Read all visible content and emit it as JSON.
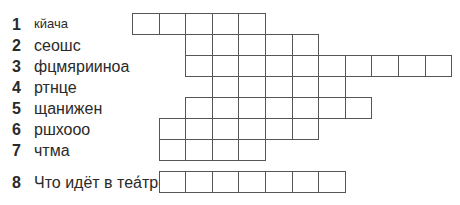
{
  "crossword": {
    "rows": [
      {
        "number": "1",
        "clue": "кйача",
        "start_col": 0,
        "cells": 5
      },
      {
        "number": "2",
        "clue": "сеошс",
        "start_col": 2,
        "cells": 5
      },
      {
        "number": "3",
        "clue": "фцмяриинoа",
        "start_col": 2,
        "cells": 10
      },
      {
        "number": "4",
        "clue": "ртнце",
        "start_col": 3,
        "cells": 5
      },
      {
        "number": "5",
        "clue": "щанижен",
        "start_col": 2,
        "cells": 7
      },
      {
        "number": "6",
        "clue": "ршхооо",
        "start_col": 1,
        "cells": 6
      },
      {
        "number": "7",
        "clue": "чтма",
        "start_col": 1,
        "cells": 4
      }
    ],
    "final": {
      "number": "8",
      "clue": "Что идёт в теа́тре?",
      "start_col": 1,
      "cells": 7
    }
  }
}
